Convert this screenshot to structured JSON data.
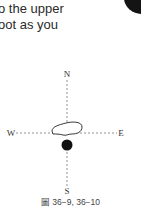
{
  "text": {
    "line1": "o the upper",
    "line2": "oot as you"
  },
  "compass": {
    "north": "N",
    "south": "S",
    "west": "W",
    "east": "E"
  },
  "caption": "圖 36−9, 36−10",
  "colors": {
    "ink": "#1a1a1a",
    "dashed": "#777777"
  }
}
